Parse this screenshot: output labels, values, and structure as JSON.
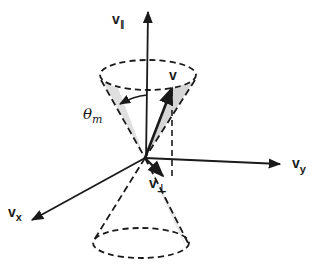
{
  "figure": {
    "labels": {
      "v_parallel": {
        "main": "v",
        "sub": "∥"
      },
      "v": {
        "main": "v"
      },
      "theta_m": {
        "main": "θ",
        "sub": "m"
      },
      "v_perp": {
        "main": "v",
        "sub": "⊥"
      },
      "v_y": {
        "main": "v",
        "sub": "y"
      },
      "v_x": {
        "main": "v",
        "sub": "x"
      }
    },
    "colors": {
      "line": "#1a1a1a",
      "shade": "#cfcfcf",
      "background": "#ffffff"
    }
  }
}
